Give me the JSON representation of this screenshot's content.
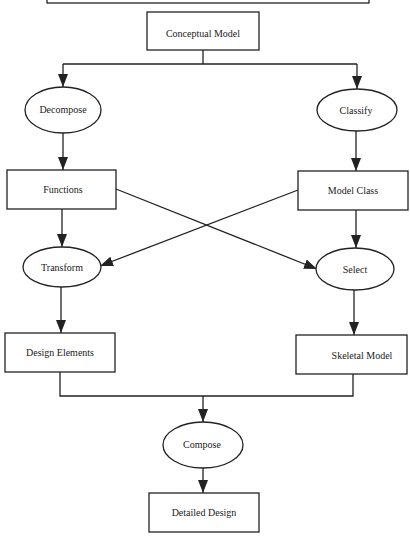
{
  "diagram": {
    "title": "",
    "colors": {
      "stroke": "#222222",
      "text": "#1a1a1a",
      "background": "#ffffff"
    },
    "nodes": {
      "top_box": {
        "label": "",
        "shape": "rectangle",
        "note": "partially visible, cut off at top edge"
      },
      "conceptual_model": {
        "label": "Conceptual Model",
        "shape": "rectangle"
      },
      "decompose": {
        "label": "Decompose",
        "shape": "ellipse"
      },
      "classify": {
        "label": "Classify",
        "shape": "ellipse"
      },
      "functions": {
        "label": "Functions",
        "shape": "rectangle"
      },
      "model_class": {
        "label": "Model Class",
        "shape": "rectangle"
      },
      "transform": {
        "label": "Transform",
        "shape": "ellipse"
      },
      "select": {
        "label": "Select",
        "shape": "ellipse"
      },
      "design_elements": {
        "label": "Design Elements",
        "shape": "rectangle"
      },
      "skeletal_model": {
        "label": "Skeletal Model",
        "shape": "rectangle"
      },
      "compose": {
        "label": "Compose",
        "shape": "ellipse"
      },
      "detailed_design": {
        "label": "Detailed Design",
        "shape": "rectangle"
      }
    },
    "edges": [
      {
        "from": "Conceptual Model",
        "to": "Decompose"
      },
      {
        "from": "Conceptual Model",
        "to": "Classify"
      },
      {
        "from": "Decompose",
        "to": "Functions"
      },
      {
        "from": "Classify",
        "to": "Model Class"
      },
      {
        "from": "Functions",
        "to": "Transform"
      },
      {
        "from": "Functions",
        "to": "Select"
      },
      {
        "from": "Model Class",
        "to": "Select"
      },
      {
        "from": "Model Class",
        "to": "Transform"
      },
      {
        "from": "Transform",
        "to": "Design Elements"
      },
      {
        "from": "Select",
        "to": "Skeletal Model"
      },
      {
        "from": "Design Elements",
        "to": "Compose"
      },
      {
        "from": "Skeletal Model",
        "to": "Compose"
      },
      {
        "from": "Compose",
        "to": "Detailed Design"
      }
    ]
  }
}
